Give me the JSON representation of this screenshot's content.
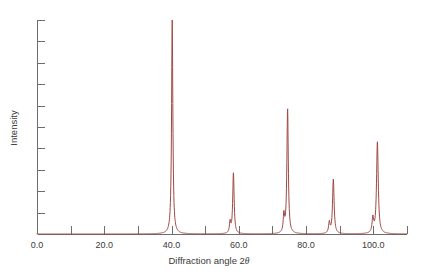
{
  "chart_data": {
    "type": "line",
    "title": "",
    "subtitle": "",
    "xlabel_prefix": "Diffraction angle 2",
    "xlabel_symbol": "θ",
    "ylabel": "Intensity",
    "xlim": [
      0,
      110
    ],
    "ylim": [
      0,
      100
    ],
    "grid": false,
    "legend": null,
    "x_tick_labels": [
      "0.0",
      "20.0",
      "40.0",
      "60.0",
      "80.0",
      "100.0"
    ],
    "x_tick_values": [
      0,
      20,
      40,
      60,
      80,
      100
    ],
    "x_minor_tick_values": [
      10,
      30,
      50,
      70,
      90,
      110
    ],
    "y_tick_count": 11,
    "y_tick_labels": [],
    "series_name": "diffraction-pattern",
    "series_color": "#9e4a44",
    "peaks": [
      {
        "two_theta": 40.2,
        "intensity": 100.0,
        "width": 0.45,
        "shoulder_offset": 0.85,
        "shoulder_ratio": 0.0
      },
      {
        "two_theta": 58.4,
        "intensity": 28.5,
        "width": 0.5,
        "shoulder_offset": 1.0,
        "shoulder_ratio": 0.18
      },
      {
        "two_theta": 74.5,
        "intensity": 58.5,
        "width": 0.5,
        "shoulder_offset": 1.1,
        "shoulder_ratio": 0.14
      },
      {
        "two_theta": 88.1,
        "intensity": 25.5,
        "width": 0.55,
        "shoulder_offset": 1.2,
        "shoulder_ratio": 0.2
      },
      {
        "two_theta": 101.2,
        "intensity": 43.0,
        "width": 0.6,
        "shoulder_offset": 1.35,
        "shoulder_ratio": 0.16
      }
    ]
  },
  "axes_geometry": {
    "left_px": 37,
    "right_px": 407,
    "baseline_px": 234,
    "top_px": 20
  }
}
